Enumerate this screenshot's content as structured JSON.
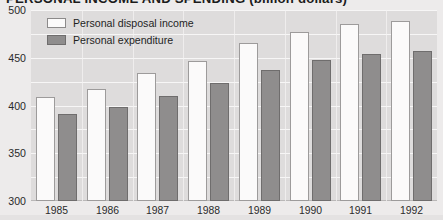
{
  "chart_data": {
    "type": "bar",
    "title": "PERSONAL INCOME AND SPENDING (billion dollars)",
    "xlabel": "",
    "ylabel": "",
    "ylim": [
      100,
      500
    ],
    "ytick_step": 50,
    "yticks": [
      "500",
      "450",
      "400",
      "350",
      "300",
      "250",
      "200",
      "150",
      "100"
    ],
    "grid": true,
    "legend_position": "top-left",
    "categories": [
      "1985",
      "1986",
      "1987",
      "1988",
      "1989",
      "1990",
      "1991",
      "1992"
    ],
    "series": [
      {
        "name": "Personal disposal income",
        "color": "#fbfafa",
        "values": [
          318,
          335,
          368,
          393,
          430,
          455,
          470,
          478
        ]
      },
      {
        "name": "Personal expenditure",
        "color": "#8f8d8d",
        "values": [
          283,
          297,
          320,
          348,
          375,
          395,
          408,
          414
        ]
      }
    ]
  },
  "colors": {
    "page_background": "#edebeb",
    "plot_background": "#dedcdc",
    "gridline": "#f7f6f6",
    "axis": "#b9b7b7",
    "income_fill": "#fbfafa",
    "income_stroke": "#9d9b9b",
    "expenditure_fill": "#8f8d8d",
    "expenditure_stroke": "#6f6d6d",
    "text": "#1f1f1f"
  }
}
